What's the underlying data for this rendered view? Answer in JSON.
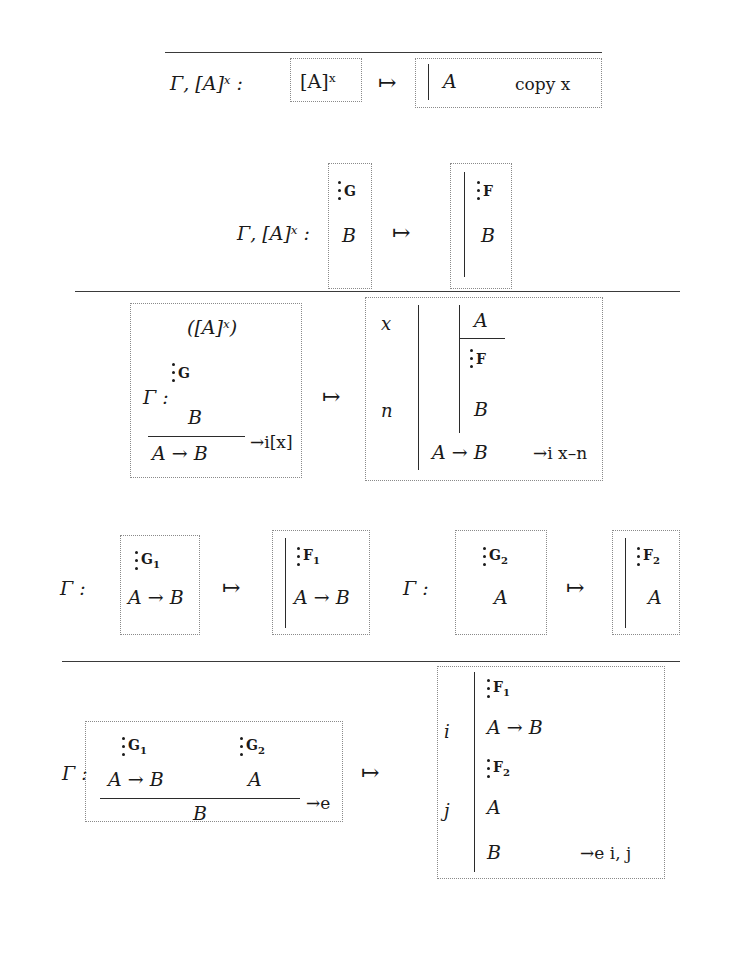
{
  "figure": {
    "kind": "proof-translation-rules",
    "mapsto": "↦",
    "arrow": "→",
    "context_gamma": "Γ"
  },
  "rule_copy": {
    "name": "copy-rule",
    "context": "Γ, [A]ˣ :",
    "source": "[A]ˣ",
    "target_formula": "A",
    "target_justification": "copy x"
  },
  "rule_assumption": {
    "name": "assumption-rule",
    "context": "Γ, [A]ˣ :",
    "source_deriv": "G",
    "source_formula": "B",
    "target_deriv": "F",
    "target_formula": "B"
  },
  "rule_imp_intro": {
    "name": "implication-introduction-rule",
    "context": "Γ :",
    "source_discharge": "([A]ˣ)",
    "source_deriv": "G",
    "source_premise": "B",
    "source_conclusion": "A → B",
    "source_justification": "→i[x]",
    "target_line_x": "x",
    "target_line_n": "n",
    "target_assumption": "A",
    "target_deriv": "F",
    "target_subconclusion": "B",
    "target_conclusion": "A → B",
    "target_justification": "→i x–n"
  },
  "rule_imp_elim_premises": {
    "name": "implication-elimination-premise-rules",
    "left": {
      "context": "Γ :",
      "source_deriv": "G",
      "source_sub": "1",
      "source_formula": "A → B",
      "target_deriv": "F",
      "target_sub": "1",
      "target_formula": "A → B"
    },
    "right": {
      "context": "Γ :",
      "source_deriv": "G",
      "source_sub": "2",
      "source_formula": "A",
      "target_deriv": "F",
      "target_sub": "2",
      "target_formula": "A"
    }
  },
  "rule_imp_elim": {
    "name": "implication-elimination-rule",
    "context": "Γ :",
    "source_deriv_left": "G",
    "source_deriv_left_sub": "1",
    "source_deriv_right": "G",
    "source_deriv_right_sub": "2",
    "source_major": "A → B",
    "source_minor": "A",
    "source_conclusion": "B",
    "source_justification": "→e",
    "target_deriv_1": "F",
    "target_deriv_1_sub": "1",
    "target_line_i": "i",
    "target_major": "A → B",
    "target_deriv_2": "F",
    "target_deriv_2_sub": "2",
    "target_line_j": "j",
    "target_minor": "A",
    "target_conclusion": "B",
    "target_justification": "→e i, j"
  }
}
